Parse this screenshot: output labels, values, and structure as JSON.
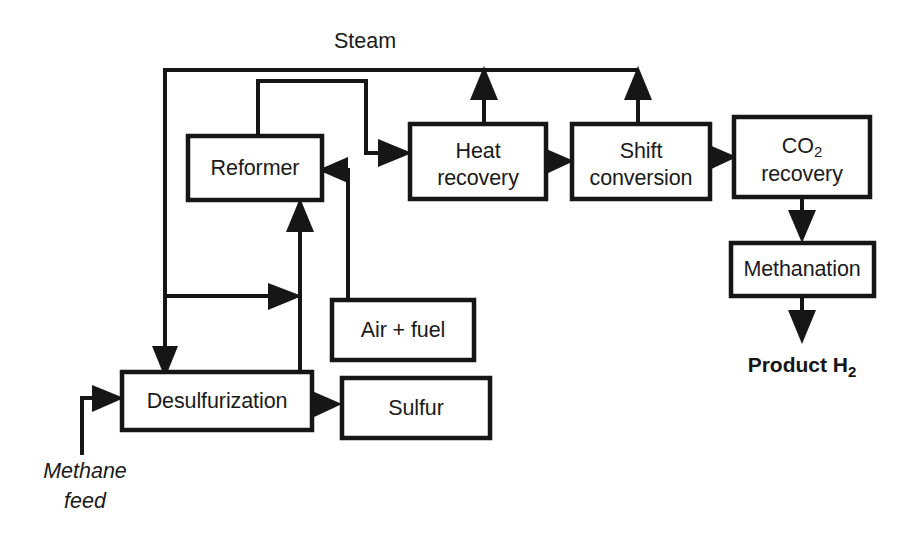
{
  "diagram": {
    "colors": {
      "line": "#161616",
      "box_fill": "#ffffff",
      "text": "#1a1a1a",
      "background": "#ffffff"
    },
    "boxes": [
      {
        "id": "reformer",
        "label": "Reformer",
        "label_line1": "Reformer",
        "label_line2": ""
      },
      {
        "id": "heat-recovery",
        "label": "Heat recovery",
        "label_line1": "Heat",
        "label_line2": "recovery"
      },
      {
        "id": "shift-conversion",
        "label": "Shift conversion",
        "label_line1": "Shift",
        "label_line2": "conversion"
      },
      {
        "id": "co2-recovery",
        "label": "CO2 recovery",
        "label_line1": "CO",
        "label_line1_sub": "2",
        "label_line2": "recovery"
      },
      {
        "id": "methanation",
        "label": "Methanation",
        "label_line1": "Methanation",
        "label_line2": ""
      },
      {
        "id": "air-fuel",
        "label": "Air + fuel",
        "label_line1": "Air + fuel",
        "label_line2": ""
      },
      {
        "id": "desulfurization",
        "label": "Desulfurization",
        "label_line1": "Desulfurization",
        "label_line2": ""
      },
      {
        "id": "sulfur",
        "label": "Sulfur",
        "label_line1": "Sulfur",
        "label_line2": ""
      }
    ],
    "stream_labels": {
      "steam": "Steam",
      "product_prefix": "Product H",
      "product_subscript": "2",
      "feed_line1": "Methane",
      "feed_line2": "feed"
    }
  }
}
